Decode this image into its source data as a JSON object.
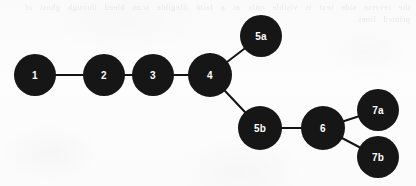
{
  "figure": {
    "kind": "node-link-graph",
    "background_color": "#fbfbfb",
    "node_color": "#161616",
    "node_label_color": "#ffffff",
    "edge_color": "#141414",
    "edge_width": 2,
    "node_radius": 21,
    "canvas": {
      "width": 416,
      "height": 186
    }
  },
  "bleed_through": {
    "visible": true,
    "legible": false,
    "text": "the reverse side text is visible only as a faint illegible scan bleed through ghost of printed lines"
  },
  "chart_data": {
    "type": "diagram",
    "title": "",
    "nodes": [
      {
        "id": "1",
        "label": "1",
        "x": 35,
        "y": 75,
        "r": 21
      },
      {
        "id": "2",
        "label": "2",
        "x": 104,
        "y": 75,
        "r": 21
      },
      {
        "id": "3",
        "label": "3",
        "x": 153,
        "y": 75,
        "r": 21
      },
      {
        "id": "4",
        "label": "4",
        "x": 210,
        "y": 75,
        "r": 22
      },
      {
        "id": "5a",
        "label": "5a",
        "x": 261,
        "y": 36,
        "r": 21
      },
      {
        "id": "5b",
        "label": "5b",
        "x": 260,
        "y": 128,
        "r": 22
      },
      {
        "id": "6",
        "label": "6",
        "x": 323,
        "y": 128,
        "r": 22
      },
      {
        "id": "7a",
        "label": "7a",
        "x": 378,
        "y": 110,
        "r": 21
      },
      {
        "id": "7b",
        "label": "7b",
        "x": 378,
        "y": 157,
        "r": 21
      }
    ],
    "edges": [
      {
        "source": "1",
        "target": "2"
      },
      {
        "source": "2",
        "target": "3"
      },
      {
        "source": "3",
        "target": "4"
      },
      {
        "source": "4",
        "target": "5a"
      },
      {
        "source": "4",
        "target": "5b"
      },
      {
        "source": "5b",
        "target": "6"
      },
      {
        "source": "6",
        "target": "7a"
      },
      {
        "source": "6",
        "target": "7b"
      }
    ]
  }
}
